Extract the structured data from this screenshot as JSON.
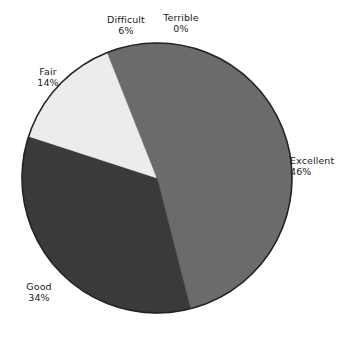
{
  "chart_data": {
    "type": "pie",
    "title": "",
    "subtitle": "",
    "xlabel": "",
    "ylabel": "",
    "legend_position": "none",
    "grid": false,
    "label_format": "category above percent",
    "categories": [
      "Excellent",
      "Good",
      "Fair",
      "Difficult",
      "Terrible"
    ],
    "values": [
      46,
      34,
      14,
      6,
      0
    ],
    "value_labels": [
      "46%",
      "34%",
      "14%",
      "6%",
      "0%"
    ],
    "units": "percent",
    "total": 100,
    "start_angle_deg": 0,
    "direction": "clockwise",
    "slices": [
      {
        "name": "Excellent",
        "value": 46,
        "label": "Excellent",
        "percent_label": "46%",
        "color": "#6b6b6b",
        "start_deg": 0,
        "end_deg": 165.6
      },
      {
        "name": "Good",
        "value": 34,
        "label": "Good",
        "percent_label": "34%",
        "color": "#3a3a3a",
        "start_deg": 165.6,
        "end_deg": 288.0
      },
      {
        "name": "Fair",
        "value": 14,
        "label": "Fair",
        "percent_label": "14%",
        "color": "#ececec",
        "start_deg": 288.0,
        "end_deg": 338.4
      },
      {
        "name": "Difficult",
        "value": 6,
        "label": "Difficult",
        "percent_label": "6%",
        "color": "#6b6b6b",
        "start_deg": 338.4,
        "end_deg": 360.0
      },
      {
        "name": "Terrible",
        "value": 0,
        "label": "Terrible",
        "percent_label": "0%",
        "color": "#6b6b6b",
        "start_deg": 360.0,
        "end_deg": 360.0
      }
    ]
  },
  "colors": {
    "background": "#ffffff",
    "text": "#1a1a1a",
    "outline": "#222222",
    "excellent": "#6b6b6b",
    "good": "#3a3a3a",
    "fair": "#ececec",
    "difficult": "#6b6b6b",
    "terrible": "#6b6b6b"
  }
}
